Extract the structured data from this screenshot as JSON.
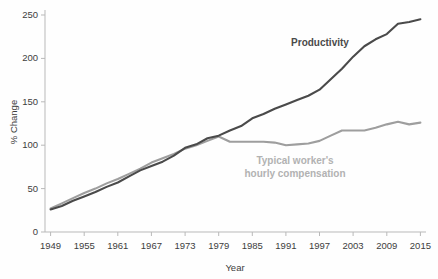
{
  "chart_data": {
    "type": "line",
    "title": "",
    "xlabel": "Year",
    "ylabel": "% Change",
    "xlim": [
      1948,
      2016
    ],
    "ylim": [
      0,
      260
    ],
    "grid": false,
    "legend_position": "inline-annotations",
    "xticks": [
      1949,
      1955,
      1961,
      1967,
      1973,
      1979,
      1985,
      1991,
      1997,
      2003,
      2009,
      2015
    ],
    "yticks": [
      0,
      50,
      100,
      150,
      200,
      250
    ],
    "xtick_labels": [
      "1949",
      "1955",
      "1961",
      "1967",
      "1973",
      "1979",
      "1985",
      "1991",
      "1997",
      "2003",
      "2009",
      "2015"
    ],
    "ytick_labels": [
      "0",
      "50",
      "100",
      "150",
      "200",
      "250"
    ],
    "colors": {
      "productivity": "#4a4a4a",
      "compensation": "#9e9e9e",
      "axis": "#b9b9b9",
      "background": "#fefefe",
      "tick_text": "#3d3d3d"
    },
    "annotations": [
      {
        "name": "productivity-label",
        "text": "Productivity",
        "x": 1997,
        "y": 218,
        "color": "#4a4a4a"
      },
      {
        "name": "compensation-label-line1",
        "text": "Typical worker's",
        "x": 1994,
        "y": 80,
        "color": "#b2b2b2"
      },
      {
        "name": "compensation-label-line2",
        "text": "hourly compensation",
        "x": 1994,
        "y": 68,
        "color": "#b2b2b2"
      }
    ],
    "x": [
      1949,
      1951,
      1953,
      1955,
      1957,
      1959,
      1961,
      1963,
      1965,
      1967,
      1969,
      1971,
      1973,
      1975,
      1977,
      1979,
      1981,
      1983,
      1985,
      1987,
      1989,
      1991,
      1993,
      1995,
      1997,
      1999,
      2001,
      2003,
      2005,
      2007,
      2009,
      2011,
      2013,
      2015
    ],
    "series": [
      {
        "name": "Productivity",
        "label": "Productivity",
        "color": "#4a4a4a",
        "values": [
          26,
          30,
          36,
          41,
          46,
          52,
          57,
          64,
          71,
          76,
          81,
          88,
          97,
          101,
          108,
          111,
          117,
          122,
          131,
          136,
          142,
          147,
          152,
          157,
          164,
          176,
          188,
          202,
          214,
          222,
          228,
          240,
          242,
          245
        ]
      },
      {
        "name": "Typical worker's hourly compensation",
        "label": "Typical worker's hourly compensation",
        "color": "#9e9e9e",
        "values": [
          27,
          33,
          39,
          45,
          50,
          56,
          61,
          67,
          73,
          80,
          85,
          90,
          96,
          100,
          105,
          110,
          104,
          104,
          104,
          104,
          103,
          100,
          101,
          102,
          105,
          111,
          117,
          117,
          117,
          120,
          124,
          127,
          124,
          126
        ]
      }
    ]
  },
  "axes": {
    "x_title": "Year",
    "y_title": "% Change"
  }
}
